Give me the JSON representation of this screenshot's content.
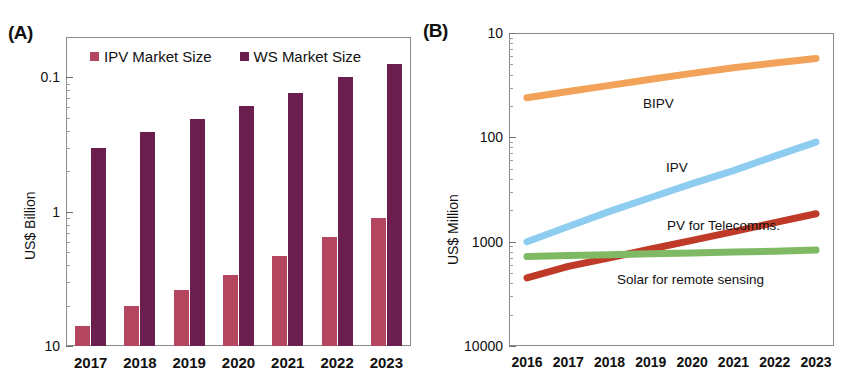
{
  "figure": {
    "panels": [
      {
        "letter": "(A)"
      },
      {
        "letter": "(B)"
      }
    ]
  },
  "panel_a": {
    "letter": "(A)",
    "ylabel": "US$ Billion",
    "legend": [
      {
        "label": "IPV Market Size",
        "color": "#b4475f",
        "key": "ipv"
      },
      {
        "label": "WS Market Size",
        "color": "#6b1f4e",
        "key": "ws"
      }
    ],
    "yticks": [
      "10",
      "1",
      "0.1"
    ],
    "xticks": [
      "2017",
      "2018",
      "2019",
      "2020",
      "2021",
      "2022",
      "2023"
    ]
  },
  "panel_b": {
    "letter": "(B)",
    "ylabel": "US$ Million",
    "yticks": [
      "10000",
      "1000",
      "100",
      "10"
    ],
    "xticks": [
      "2016",
      "2017",
      "2018",
      "2019",
      "2020",
      "2021",
      "2022",
      "2023"
    ],
    "series_labels": [
      {
        "label": "BIPV",
        "color": "#f2a359"
      },
      {
        "label": "IPV",
        "color": "#8fcdf0"
      },
      {
        "label": "PV for Telecomms.",
        "color": "#bf3b28"
      },
      {
        "label": "Solar for remote sensing",
        "color": "#7fb963"
      }
    ]
  },
  "chart_data": [
    {
      "type": "bar",
      "panel": "(A)",
      "title": "",
      "xlabel": "",
      "ylabel": "US$ Billion",
      "yscale": "log",
      "ylim": [
        0.1,
        20
      ],
      "yticks": [
        0.1,
        1,
        10
      ],
      "grid": false,
      "legend_position": "top-inside",
      "categories": [
        "2017",
        "2018",
        "2019",
        "2020",
        "2021",
        "2022",
        "2023"
      ],
      "series": [
        {
          "name": "IPV Market Size",
          "color": "#b4475f",
          "values": [
            0.14,
            0.2,
            0.26,
            0.34,
            0.47,
            0.65,
            0.9
          ]
        },
        {
          "name": "WS Market Size",
          "color": "#6b1f4e",
          "values": [
            3.0,
            3.9,
            4.9,
            6.1,
            7.7,
            10.0,
            12.7
          ]
        }
      ]
    },
    {
      "type": "line",
      "panel": "(B)",
      "title": "",
      "xlabel": "",
      "ylabel": "US$ Million",
      "yscale": "log",
      "ylim": [
        10,
        10000
      ],
      "yticks": [
        10,
        100,
        1000,
        10000
      ],
      "grid": false,
      "legend_position": "inline-annotations",
      "x": [
        "2016",
        "2017",
        "2018",
        "2019",
        "2020",
        "2021",
        "2022",
        "2023"
      ],
      "series": [
        {
          "name": "BIPV",
          "color": "#f2a359",
          "values": [
            2400,
            2750,
            3150,
            3600,
            4100,
            4650,
            5150,
            5700
          ]
        },
        {
          "name": "IPV",
          "color": "#8fcdf0",
          "values": [
            100,
            140,
            195,
            265,
            360,
            480,
            660,
            900
          ]
        },
        {
          "name": "PV for Telecomms.",
          "color": "#bf3b28",
          "values": [
            45,
            58,
            70,
            85,
            103,
            125,
            152,
            185
          ]
        },
        {
          "name": "Solar for remote sensing",
          "color": "#7fb963",
          "values": [
            72,
            73.5,
            75,
            76.5,
            78,
            79.5,
            81,
            83
          ]
        }
      ]
    }
  ]
}
